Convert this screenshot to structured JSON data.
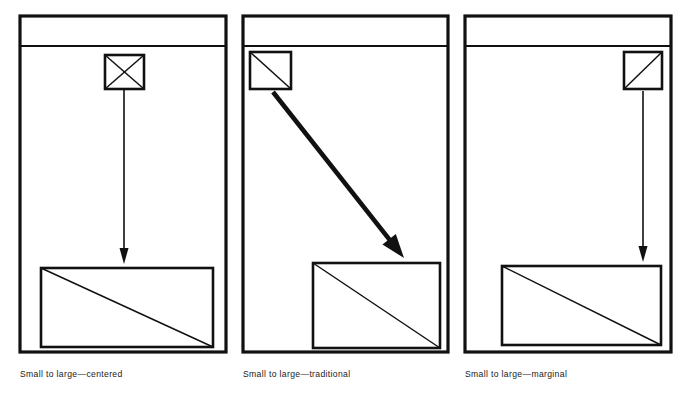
{
  "figure": {
    "background_color": "#ffffff",
    "ink_color": "#111111",
    "panels": [
      {
        "id": "centered",
        "caption": "Small to large—centered",
        "caption_x": 20,
        "caption_y": 377,
        "page": {
          "x": 20,
          "y": 16,
          "w": 206,
          "h": 336
        },
        "header_rule": {
          "x1": 20,
          "y1": 46,
          "x2": 226,
          "y2": 46
        },
        "small_block": {
          "name": "small-block",
          "x": 105,
          "y": 55,
          "w": 39,
          "h": 34,
          "diagonals": "both",
          "marker": "x-cross"
        },
        "large_block": {
          "name": "large-block",
          "x": 41,
          "y": 268,
          "w": 172,
          "h": 79,
          "diagonals": "tl-br",
          "marker": "single-diagonal"
        },
        "arrow": {
          "name": "flow-arrow-vertical",
          "x1": 124,
          "y1": 90,
          "x2": 124,
          "y2": 264,
          "width": 1.6,
          "head_w": 9,
          "head_l": 16,
          "direction": "down"
        }
      },
      {
        "id": "traditional",
        "caption": "Small to large—traditional",
        "caption_x": 243,
        "caption_y": 377,
        "page": {
          "x": 243,
          "y": 16,
          "w": 205,
          "h": 336
        },
        "header_rule": {
          "x1": 243,
          "y1": 46,
          "x2": 448,
          "y2": 46
        },
        "small_block": {
          "name": "small-block",
          "x": 250,
          "y": 52,
          "w": 41,
          "h": 37,
          "diagonals": "tl-br",
          "marker": "single-diagonal"
        },
        "large_block": {
          "name": "large-block",
          "x": 313,
          "y": 263,
          "w": 127,
          "h": 85,
          "diagonals": "tl-br",
          "marker": "single-diagonal"
        },
        "arrow": {
          "name": "flow-arrow-diagonal",
          "x1": 273,
          "y1": 92,
          "x2": 404,
          "y2": 258,
          "width": 4.6,
          "head_w": 17,
          "head_l": 24,
          "direction": "down-right"
        }
      },
      {
        "id": "marginal",
        "caption": "Small to large—marginal",
        "caption_x": 465,
        "caption_y": 377,
        "page": {
          "x": 465,
          "y": 16,
          "w": 206,
          "h": 336
        },
        "header_rule": {
          "x1": 465,
          "y1": 46,
          "x2": 671,
          "y2": 46
        },
        "small_block": {
          "name": "small-block",
          "x": 624,
          "y": 52,
          "w": 38,
          "h": 37,
          "diagonals": "bl-tr",
          "marker": "single-diagonal"
        },
        "large_block": {
          "name": "large-block",
          "x": 502,
          "y": 266,
          "w": 159,
          "h": 79,
          "diagonals": "tl-br",
          "marker": "single-diagonal"
        },
        "arrow": {
          "name": "flow-arrow-vertical",
          "x1": 643,
          "y1": 91,
          "x2": 643,
          "y2": 262,
          "width": 1.6,
          "head_w": 9,
          "head_l": 16,
          "direction": "down"
        }
      }
    ]
  }
}
